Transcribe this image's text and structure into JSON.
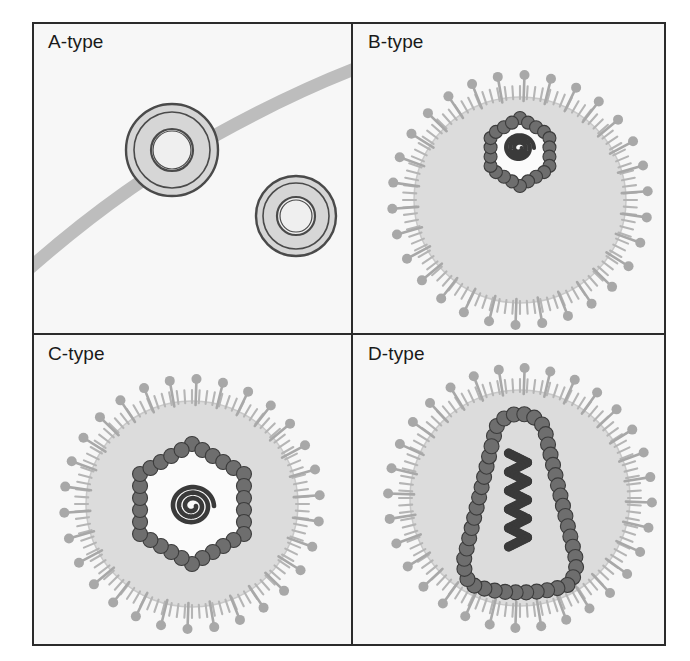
{
  "figure": {
    "background_color": "#ffffff",
    "frame": {
      "x": 33,
      "y": 23,
      "width": 632,
      "height": 622,
      "border_color": "#2b2b2b",
      "border_width": 2,
      "fill": "#f7f7f7"
    },
    "divider": {
      "vertical_x": 352,
      "horizontal_y": 334,
      "color": "#2b2b2b",
      "width": 2
    }
  },
  "palette": {
    "outline_dark": "#4a4a4a",
    "capsid_fill": "#6e6e6e",
    "capsid_stroke": "#3c3c3c",
    "envelope_fill": "#dcdcdc",
    "envelope_stroke": "#c9c9c9",
    "spike_color": "#a8a8a8",
    "fringe_color": "#b5b5b5",
    "genome_color": "#3a3a3a",
    "ring_fill": "#d6d6d6",
    "ring_inner_fill": "#efefef",
    "membrane_band_fill": "#bdbdbd",
    "panel_bg": "#f7f7f7",
    "capsid_interior": "#fbfbfb",
    "label_color": "#1a1a1a"
  },
  "panels": [
    {
      "id": "a",
      "label": "A-type",
      "label_x": 48,
      "label_y": 48,
      "description": "Intracytoplasmic A-type particles: two doughnut-shaped rings, one budding at a curved cellular membrane band",
      "has_envelope": false,
      "has_spikes": false,
      "membrane_band": {
        "present": true,
        "thickness": 13,
        "fill": "#bdbdbd",
        "stroke": "#9e9e9e"
      },
      "rings": [
        {
          "cx": 172,
          "cy": 150,
          "outer_r": 46,
          "ring_r": 38,
          "inner_r": 21,
          "inner_hole_r": 19
        },
        {
          "cx": 296,
          "cy": 216,
          "outer_r": 40,
          "ring_r": 33,
          "inner_r": 19,
          "inner_hole_r": 16
        }
      ]
    },
    {
      "id": "b",
      "label": "B-type",
      "label_x": 368,
      "label_y": 48,
      "description": "B-type particle: enveloped virion with long knobbed spikes and a small eccentric (off-centre) hexagonal nucleocapsid with condensed coiled genome",
      "has_envelope": true,
      "has_spikes": true,
      "envelope": {
        "cx": 520,
        "cy": 200,
        "rx": 106,
        "ry": 103
      },
      "spikes": {
        "long_count": 30,
        "long_length": 22,
        "knob_r": 5,
        "fringe_count": 96,
        "fringe_length": 11
      },
      "capsid": {
        "shape": "hexagon",
        "cx": 520,
        "cy": 152,
        "radius": 34,
        "bead_count": 22,
        "bead_r": 6.5,
        "eccentric": true
      },
      "genome": {
        "shape": "coil",
        "cx": 519,
        "cy": 148,
        "size": 15,
        "turns": 3
      }
    },
    {
      "id": "c",
      "label": "C-type",
      "label_x": 48,
      "label_y": 360,
      "description": "C-type particle: enveloped virion with long knobbed spikes and a large central hexagonal (icosahedral) nucleocapsid containing a spiral genome",
      "has_envelope": true,
      "has_spikes": true,
      "envelope": {
        "cx": 192,
        "cy": 504,
        "rx": 106,
        "ry": 103
      },
      "spikes": {
        "long_count": 30,
        "long_length": 22,
        "knob_r": 5,
        "fringe_count": 96,
        "fringe_length": 11
      },
      "capsid": {
        "shape": "hexagon",
        "cx": 192,
        "cy": 504,
        "radius": 60,
        "bead_count": 30,
        "bead_r": 7.5,
        "eccentric": false
      },
      "genome": {
        "shape": "spiral",
        "cx": 192,
        "cy": 506,
        "size": 22,
        "turns": 3
      }
    },
    {
      "id": "d",
      "label": "D-type",
      "label_x": 368,
      "label_y": 360,
      "description": "D-type particle: enveloped virion with long knobbed spikes and a cone- / bar-shaped nucleocapsid containing a zig-zag condensed genome",
      "has_envelope": true,
      "has_spikes": true,
      "envelope": {
        "cx": 520,
        "cy": 498,
        "rx": 110,
        "ry": 108
      },
      "spikes": {
        "long_count": 32,
        "long_length": 22,
        "knob_r": 5,
        "fringe_count": 100,
        "fringe_length": 11
      },
      "capsid": {
        "shape": "cone",
        "cx": 520,
        "cy": 500,
        "top_width": 52,
        "bottom_width": 124,
        "height": 180,
        "bead_count": 46,
        "bead_r": 7.5,
        "eccentric": false
      },
      "genome": {
        "shape": "zigzag",
        "cx": 518,
        "cy": 500,
        "size": 26,
        "turns": 5
      }
    }
  ],
  "legend_note": ""
}
